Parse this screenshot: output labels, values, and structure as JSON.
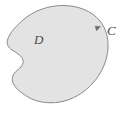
{
  "figure": {
    "name": "green-theorem-region",
    "background_color": "#ffffff",
    "region": {
      "label": "D",
      "fill_color": "#e3e3e3",
      "stroke_color": "#8a8a8a",
      "stroke_width": 1
    },
    "curve": {
      "label": "C",
      "orientation": "counterclockwise",
      "arrow_marker": "arrowhead-icon",
      "stroke_color": "#8a8a8a"
    },
    "labels": {
      "region_label": "D",
      "curve_label": "C"
    }
  }
}
